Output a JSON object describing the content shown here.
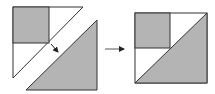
{
  "diagram": {
    "type": "quilt-block-assembly",
    "colors": {
      "fill_gray": "#b4b4b4",
      "fill_white": "#ffffff",
      "stroke": "#333333",
      "arrow": "#222222"
    },
    "steps": [
      {
        "name": "unassembled",
        "pieces": [
          "square-with-white-triangle-unit",
          "gray-triangle"
        ]
      },
      {
        "name": "assembled",
        "pieces": [
          "finished-block"
        ]
      }
    ],
    "arrows": [
      {
        "name": "join-arrow",
        "direction": "down-right"
      },
      {
        "name": "result-arrow",
        "direction": "right"
      }
    ]
  }
}
